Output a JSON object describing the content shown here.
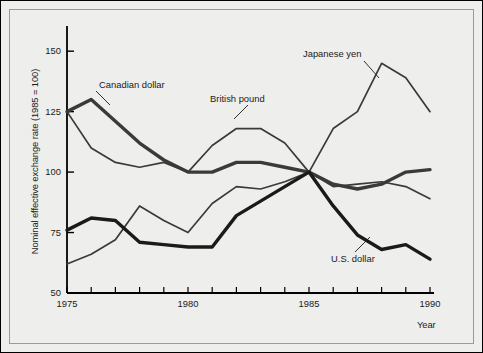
{
  "chart_data": {
    "type": "line",
    "title": "",
    "xlabel": "Year",
    "ylabel": "Nominal effective exchange rate (1985 = 100)",
    "xlim": [
      1975,
      1990
    ],
    "ylim": [
      50,
      160
    ],
    "yticks": [
      50,
      75,
      100,
      125,
      150
    ],
    "ytick_labels": [
      "50",
      "75",
      "100",
      "125",
      "150"
    ],
    "xticks": [
      1975,
      1976,
      1977,
      1978,
      1979,
      1980,
      1981,
      1982,
      1983,
      1984,
      1985,
      1986,
      1987,
      1988,
      1989,
      1990
    ],
    "xtick_labels_shown": [
      "1975",
      "1980",
      "1985",
      "1990"
    ],
    "grid": false,
    "legend": "inline annotations",
    "x": [
      1975,
      1976,
      1977,
      1978,
      1979,
      1980,
      1981,
      1982,
      1983,
      1984,
      1985,
      1986,
      1987,
      1988,
      1989,
      1990
    ],
    "series": [
      {
        "name": "Canadian dollar",
        "label": "Canadian dollar",
        "color": "#3a3a3a",
        "width": 3.4,
        "values": [
          125,
          130,
          121,
          112,
          105,
          100,
          100,
          104,
          104,
          102,
          100,
          95,
          93,
          95,
          100,
          101
        ]
      },
      {
        "name": "British pound",
        "label": "British pound",
        "color": "#3a3a3a",
        "width": 1.7,
        "values": [
          125,
          110,
          104,
          102,
          104,
          100,
          111,
          118,
          118,
          112,
          100,
          94,
          95,
          96,
          94,
          89
        ]
      },
      {
        "name": "Japanese yen",
        "label": "Japanese yen",
        "color": "#3a3a3a",
        "width": 1.7,
        "values": [
          62,
          66,
          72,
          86,
          80,
          75,
          87,
          94,
          93,
          96,
          100,
          118,
          125,
          145,
          139,
          125
        ]
      },
      {
        "name": "U.S. dollar",
        "label": "U.S. dollar",
        "color": "#1a1a1a",
        "width": 3.4,
        "values": [
          76,
          81,
          80,
          71,
          70,
          69,
          69,
          82,
          88,
          94,
          100,
          86,
          74,
          68,
          70,
          64
        ]
      }
    ],
    "annotations": [
      {
        "name": "canadian-dollar",
        "text": "Canadian dollar",
        "x": 99,
        "y": 79,
        "leader": [
          [
            96,
            91
          ],
          [
            110,
            105
          ]
        ]
      },
      {
        "name": "british-pound",
        "text": "British pound",
        "x": 210,
        "y": 93,
        "leader": [
          [
            248,
            105
          ],
          [
            234,
            119
          ]
        ]
      },
      {
        "name": "japanese-yen",
        "text": "Japanese yen",
        "x": 303,
        "y": 48,
        "leader": [
          [
            364,
            61
          ],
          [
            379,
            78
          ]
        ]
      },
      {
        "name": "us-dollar",
        "text": "U.S. dollar",
        "x": 331,
        "y": 253,
        "leader": [
          [
            355,
            252
          ],
          [
            370,
            237
          ]
        ]
      }
    ]
  }
}
